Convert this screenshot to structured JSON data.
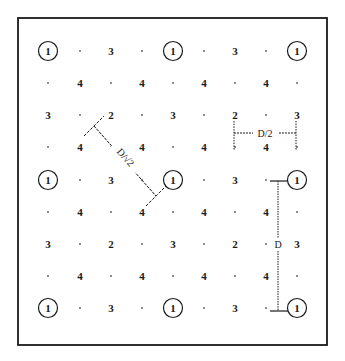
{
  "diagram": {
    "title": "",
    "border": {
      "x": 18,
      "y": 18,
      "w": 309,
      "h": 327,
      "color": "#1a1a1a"
    },
    "columns_x": [
      48,
      80,
      111,
      142,
      173,
      204,
      235,
      266,
      297
    ],
    "rows_y": [
      51,
      83,
      115,
      147,
      180,
      212,
      244,
      276,
      308
    ],
    "grid": [
      [
        "1c",
        ".",
        "3",
        ".",
        "1c",
        ".",
        "3",
        ".",
        "1c"
      ],
      [
        ".",
        "4",
        ".",
        "4",
        ".",
        "4",
        ".",
        "4",
        "."
      ],
      [
        "3",
        ".",
        "2",
        ".",
        "3",
        ".",
        "2",
        ".",
        "3"
      ],
      [
        ".",
        "4",
        ".",
        "4",
        ".",
        "4",
        ".",
        "4",
        "."
      ],
      [
        "1c",
        ".",
        "3",
        ".",
        "1c",
        ".",
        "3",
        ".",
        "1c"
      ],
      [
        ".",
        "4",
        ".",
        "4",
        ".",
        "4",
        ".",
        "4",
        "."
      ],
      [
        "3",
        ".",
        "2",
        ".",
        "3",
        ".",
        "2",
        ".",
        "3"
      ],
      [
        ".",
        "4",
        ".",
        "4",
        ".",
        "4",
        ".",
        "4",
        "."
      ],
      [
        "1c",
        ".",
        "3",
        ".",
        "1c",
        ".",
        "3",
        ".",
        "1c"
      ]
    ],
    "legend_note": "1c = numeral 1 inside a circle",
    "annotations": {
      "diagonal_label": "D/√2",
      "half_label": "D/2",
      "full_label": "D"
    }
  }
}
